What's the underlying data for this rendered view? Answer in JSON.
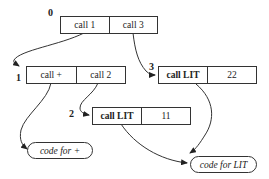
{
  "diagram": {
    "records": [
      {
        "id": "0",
        "label": "0",
        "cells": [
          "call 1",
          "call 3"
        ],
        "bold_first": false
      },
      {
        "id": "1",
        "label": "1",
        "cells": [
          "call +",
          "call 2"
        ],
        "bold_first": false
      },
      {
        "id": "3",
        "label": "3",
        "cells": [
          "call LIT",
          "22"
        ],
        "bold_first": true
      },
      {
        "id": "2",
        "label": "2",
        "cells": [
          "call LIT",
          "11"
        ],
        "bold_first": true
      }
    ],
    "code_blocks": [
      {
        "id": "plus",
        "label": "code for +"
      },
      {
        "id": "lit",
        "label": "code for LIT"
      }
    ],
    "edges": [
      {
        "from": "0.call 1",
        "to": "1"
      },
      {
        "from": "0.call 3",
        "to": "3"
      },
      {
        "from": "1.call +",
        "to": "code for +"
      },
      {
        "from": "1.call 2",
        "to": "2"
      },
      {
        "from": "3.call LIT",
        "to": "code for LIT"
      },
      {
        "from": "2.call LIT",
        "to": "code for LIT"
      }
    ],
    "colors": {
      "line": "#333333",
      "background": "#ffffff"
    }
  }
}
